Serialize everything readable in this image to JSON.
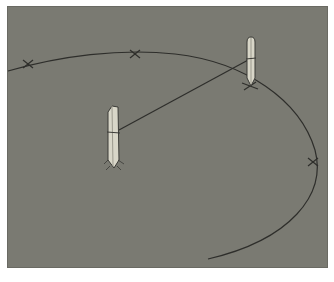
{
  "diagram": {
    "title": "",
    "colors": {
      "background": "#7a7a72",
      "line": "#2e2e2b",
      "stake_fill": "#d8d6c8",
      "stake_stroke": "#3a3a36"
    },
    "stakes": [
      {
        "id": "stake-left",
        "label": "",
        "x": 113,
        "y": 106
      },
      {
        "id": "stake-right",
        "label": "",
        "x": 252,
        "y": 38
      }
    ],
    "curve_marks": [
      {
        "id": "mark-1",
        "x": 28,
        "y": 64
      },
      {
        "id": "mark-2",
        "x": 135,
        "y": 54
      },
      {
        "id": "mark-3",
        "x": 250,
        "y": 86
      },
      {
        "id": "mark-4",
        "x": 313,
        "y": 162
      }
    ],
    "string_line": {
      "from": "stake-left",
      "to": "stake-right"
    }
  }
}
